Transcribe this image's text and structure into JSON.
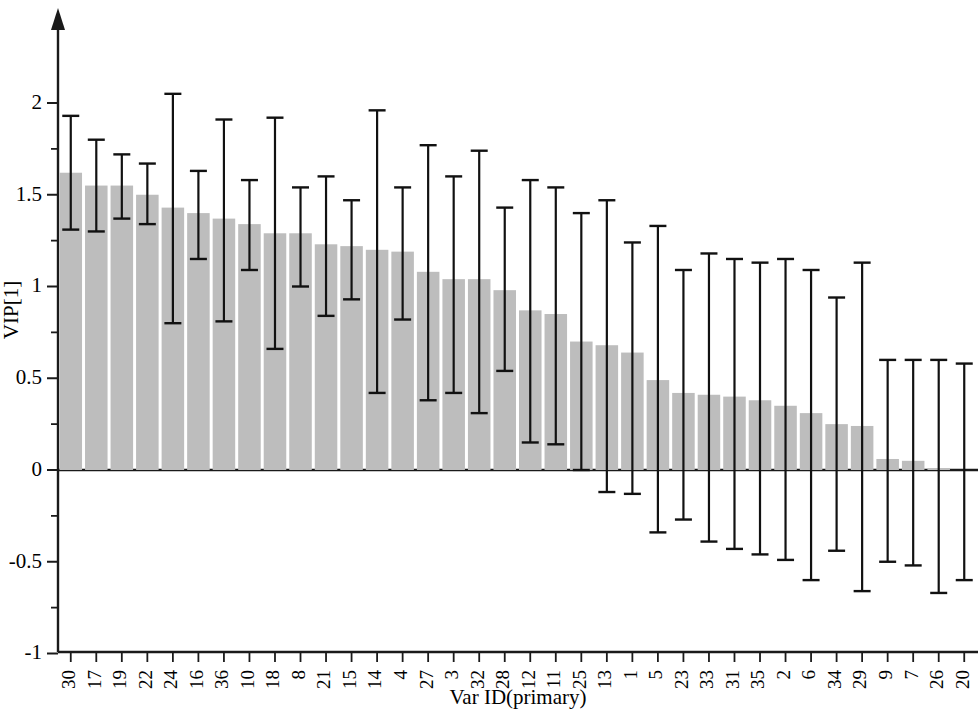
{
  "chart_data": {
    "type": "bar",
    "title": "",
    "subtitle": "",
    "xlabel": "Var ID(primary)",
    "ylabel": "VIP[1]",
    "ylim": [
      -1,
      2.35
    ],
    "ytick_values": [
      -1,
      -0.5,
      0,
      0.5,
      1,
      1.5,
      2
    ],
    "ytick_labels": [
      "-1",
      "-0.5",
      "0",
      "0.5",
      "1",
      "1.5",
      "2"
    ],
    "yminor_values": [
      -0.75,
      -0.25,
      0.25,
      0.75,
      1.25,
      1.75
    ],
    "grid": false,
    "legend": null,
    "bar_color": "#bdbdbd",
    "errorbar_color": "#111111",
    "axis_color": "#1a1a1a",
    "categories": [
      "30",
      "17",
      "19",
      "22",
      "24",
      "16",
      "36",
      "10",
      "18",
      "8",
      "21",
      "15",
      "14",
      "4",
      "27",
      "3",
      "32",
      "28",
      "12",
      "11",
      "25",
      "13",
      "1",
      "5",
      "23",
      "33",
      "31",
      "35",
      "2",
      "6",
      "34",
      "29",
      "9",
      "7",
      "26",
      "20"
    ],
    "values": [
      1.62,
      1.55,
      1.55,
      1.5,
      1.43,
      1.4,
      1.37,
      1.34,
      1.29,
      1.29,
      1.23,
      1.22,
      1.2,
      1.19,
      1.08,
      1.04,
      1.04,
      0.98,
      0.87,
      0.85,
      0.7,
      0.68,
      0.64,
      0.49,
      0.42,
      0.41,
      0.4,
      0.38,
      0.35,
      0.31,
      0.25,
      0.24,
      0.06,
      0.05,
      0.01,
      0.0
    ],
    "error_upper": [
      1.93,
      1.8,
      1.72,
      1.67,
      2.05,
      1.63,
      1.91,
      1.58,
      1.92,
      1.54,
      1.6,
      1.47,
      1.96,
      1.54,
      1.77,
      1.6,
      1.74,
      1.43,
      1.58,
      1.54,
      1.4,
      1.47,
      1.24,
      1.33,
      1.09,
      1.18,
      1.15,
      1.13,
      1.15,
      1.09,
      0.94,
      1.13,
      0.6,
      0.6,
      0.6,
      0.58
    ],
    "error_lower": [
      1.31,
      1.3,
      1.37,
      1.34,
      0.8,
      1.15,
      0.81,
      1.09,
      0.66,
      1.0,
      0.84,
      0.93,
      0.42,
      0.82,
      0.38,
      0.42,
      0.31,
      0.54,
      0.15,
      0.14,
      0.0,
      -0.12,
      -0.13,
      -0.34,
      -0.27,
      -0.39,
      -0.43,
      -0.46,
      -0.49,
      -0.6,
      -0.44,
      -0.66,
      -0.5,
      -0.52,
      -0.67,
      -0.6
    ]
  },
  "axes": {
    "y_title": "VIP[1]",
    "x_title": "Var ID(primary)"
  },
  "icons": {
    "y_axis_arrow": "arrow-up-icon"
  }
}
